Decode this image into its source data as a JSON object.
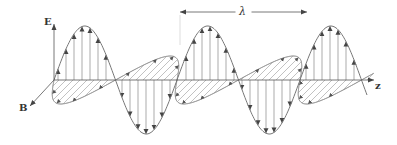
{
  "labels": {
    "e_axis": "E",
    "b_axis": "B",
    "z_axis": "z",
    "wavelength": "λ"
  },
  "colors": {
    "background": "#ffffff",
    "line": "#555555",
    "wave": "#777777",
    "text": "#333333"
  },
  "geometry": {
    "origin_x": 54,
    "axis_y": 80,
    "z_end_x": 374,
    "e_axis_top_y": 24,
    "b_axis_end": [
      30,
      106
    ],
    "half_wavelength_px": 61.5,
    "e_amplitude_px": 54,
    "b_amplitude_dx": -24,
    "b_amplitude_dy": 24,
    "cycles": 2.55,
    "e_vector_spacing_px": 8,
    "b_vector_count_per_half": 6,
    "lambda_arrow": {
      "x1": 180,
      "x2": 307,
      "y": 12
    }
  },
  "label_positions": {
    "e_axis": [
      44,
      17
    ],
    "b_axis": [
      19,
      103
    ],
    "z_axis": [
      375,
      81
    ],
    "wavelength": [
      237,
      6
    ]
  }
}
